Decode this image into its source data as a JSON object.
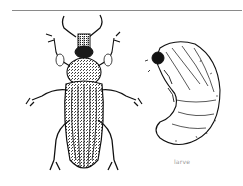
{
  "figure": {
    "subject_left": "adult beetle (weevil)",
    "subject_right": "larva",
    "caption": "larve"
  },
  "colors": {
    "ink": "#111111",
    "rule": "#8a8a8a",
    "caption": "#9a9a9a",
    "background": "#ffffff"
  }
}
